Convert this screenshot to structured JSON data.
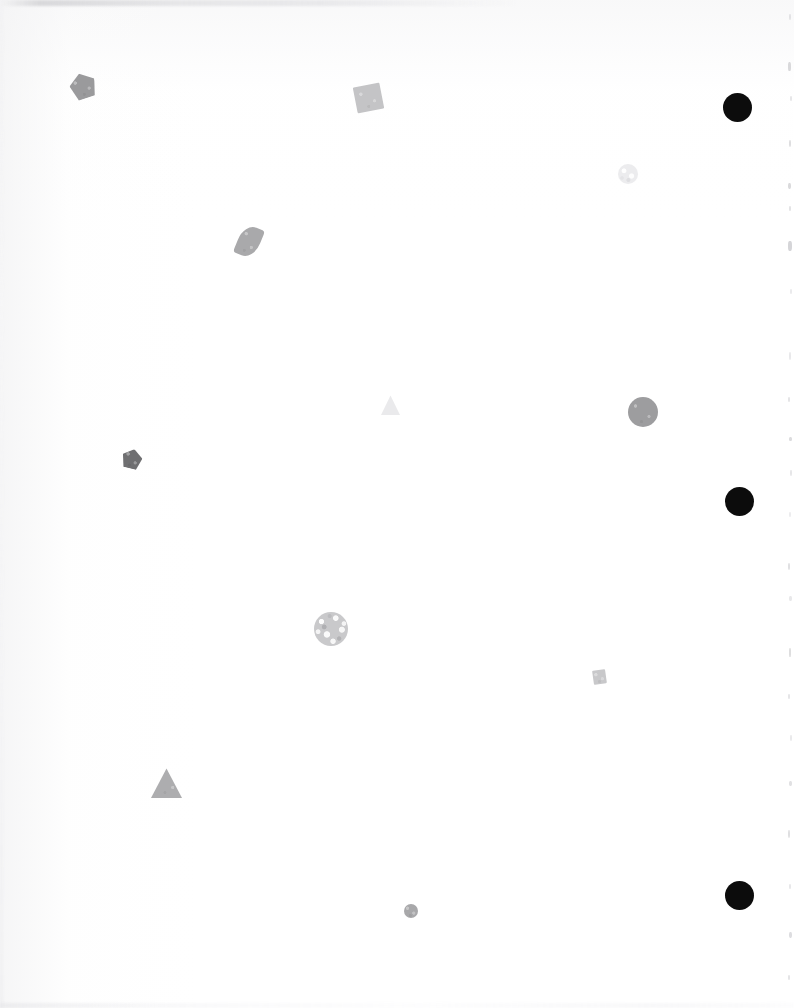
{
  "page": {
    "width": 794,
    "height": 1008,
    "background_color": "#ffffff",
    "shape_count": 13
  },
  "artifacts": {
    "top_smudge_label": "top-edge scan smudge",
    "bottom_smudge_label": "bottom-edge scan smudge",
    "left_edge_label": "left paper edge shading",
    "right_edge_label": "right margin specks",
    "right_edge_flecks": [
      {
        "x": 9,
        "y": 14,
        "w": 2,
        "h": 6,
        "color": "#e2e2e4"
      },
      {
        "x": 8,
        "y": 62,
        "w": 3,
        "h": 9,
        "color": "#d9d9db"
      },
      {
        "x": 10,
        "y": 96,
        "w": 2,
        "h": 5,
        "color": "#e6e6e8"
      },
      {
        "x": 9,
        "y": 140,
        "w": 2,
        "h": 7,
        "color": "#dedee0"
      },
      {
        "x": 8,
        "y": 183,
        "w": 3,
        "h": 6,
        "color": "#dadadc"
      },
      {
        "x": 9,
        "y": 206,
        "w": 2,
        "h": 5,
        "color": "#e3e3e5"
      },
      {
        "x": 8,
        "y": 241,
        "w": 4,
        "h": 10,
        "color": "#d5d5d8"
      },
      {
        "x": 10,
        "y": 289,
        "w": 2,
        "h": 5,
        "color": "#eaeaec"
      },
      {
        "x": 9,
        "y": 352,
        "w": 2,
        "h": 8,
        "color": "#e8e8ea"
      },
      {
        "x": 8,
        "y": 397,
        "w": 2,
        "h": 5,
        "color": "#e4e4e6"
      },
      {
        "x": 9,
        "y": 437,
        "w": 3,
        "h": 4,
        "color": "#dcdcde"
      },
      {
        "x": 10,
        "y": 470,
        "w": 2,
        "h": 6,
        "color": "#e6e6e8"
      },
      {
        "x": 9,
        "y": 512,
        "w": 2,
        "h": 5,
        "color": "#ececee"
      },
      {
        "x": 8,
        "y": 563,
        "w": 2,
        "h": 7,
        "color": "#e0e0e2"
      },
      {
        "x": 9,
        "y": 596,
        "w": 3,
        "h": 5,
        "color": "#e8e8ea"
      },
      {
        "x": 9,
        "y": 648,
        "w": 2,
        "h": 9,
        "color": "#dededf"
      },
      {
        "x": 8,
        "y": 694,
        "w": 2,
        "h": 5,
        "color": "#e5e5e7"
      },
      {
        "x": 10,
        "y": 735,
        "w": 2,
        "h": 6,
        "color": "#e9e9eb"
      },
      {
        "x": 9,
        "y": 781,
        "w": 3,
        "h": 5,
        "color": "#e1e1e3"
      },
      {
        "x": 8,
        "y": 830,
        "w": 2,
        "h": 8,
        "color": "#dfdfe1"
      },
      {
        "x": 9,
        "y": 884,
        "w": 2,
        "h": 5,
        "color": "#e7e7e9"
      },
      {
        "x": 9,
        "y": 932,
        "w": 3,
        "h": 6,
        "color": "#dddde0"
      },
      {
        "x": 8,
        "y": 975,
        "w": 2,
        "h": 5,
        "color": "#e4e4e6"
      }
    ]
  },
  "shapes": [
    {
      "id": "pentagon-top-left",
      "kind": "pentagon",
      "label": "gray pentagon",
      "x": 70,
      "y": 73,
      "w": 26,
      "h": 26,
      "rotation": -18,
      "color": "#9a9a9c",
      "texture": "grainy",
      "center_x": 83,
      "center_y": 86
    },
    {
      "id": "square-top-center",
      "kind": "square",
      "label": "light gray tilted square",
      "x": 355,
      "y": 85,
      "w": 27,
      "h": 26,
      "rotation": -11,
      "color": "#c4c4c6",
      "texture": "grainy",
      "center_x": 368,
      "center_y": 98
    },
    {
      "id": "circle-black-top-right",
      "kind": "circle",
      "label": "solid black circle",
      "x": 723,
      "y": 93,
      "w": 29,
      "h": 29,
      "rotation": 0,
      "color": "#0c0c0c",
      "texture": "solid",
      "center_x": 738,
      "center_y": 108
    },
    {
      "id": "circle-faint-upper-right",
      "kind": "circle",
      "label": "faint mottled circle",
      "x": 618,
      "y": 164,
      "w": 20,
      "h": 20,
      "rotation": 0,
      "color": "#e2e2e4",
      "texture": "faint-noise",
      "center_x": 628,
      "center_y": 174
    },
    {
      "id": "lens-upper-left",
      "kind": "lens",
      "label": "gray leaf-shaped blob",
      "x": 238,
      "y": 226,
      "w": 22,
      "h": 31,
      "rotation": 22,
      "color": "#a9a9ab",
      "texture": "grainy",
      "center_x": 249,
      "center_y": 241
    },
    {
      "id": "triangle-faint-center",
      "kind": "triangle",
      "label": "very faint light triangle",
      "x": 381,
      "y": 395,
      "w": 19,
      "h": 20,
      "rotation": 0,
      "color": "#eaeaec",
      "texture": "solid",
      "center_x": 390,
      "center_y": 405
    },
    {
      "id": "circle-gray-mid-right",
      "kind": "circle",
      "label": "medium gray circle",
      "x": 628,
      "y": 397,
      "w": 30,
      "h": 30,
      "rotation": 0,
      "color": "#9d9d9f",
      "texture": "grainy",
      "center_x": 643,
      "center_y": 412
    },
    {
      "id": "pentagon-mid-left",
      "kind": "pentagon",
      "label": "dark gray pentagon",
      "x": 122,
      "y": 449,
      "w": 20,
      "h": 20,
      "rotation": 14,
      "color": "#6f6f71",
      "texture": "grainy",
      "center_x": 132,
      "center_y": 459
    },
    {
      "id": "circle-black-mid-right",
      "kind": "circle",
      "label": "solid black circle",
      "x": 725,
      "y": 487,
      "w": 29,
      "h": 29,
      "rotation": 0,
      "color": "#0c0c0c",
      "texture": "solid",
      "center_x": 740,
      "center_y": 502
    },
    {
      "id": "circle-textured-center",
      "kind": "circle",
      "label": "mottled textured circle",
      "x": 314,
      "y": 612,
      "w": 34,
      "h": 34,
      "rotation": 0,
      "color": "#c9c9cb",
      "texture": "noise",
      "center_x": 331,
      "center_y": 629
    },
    {
      "id": "square-small-lower-right",
      "kind": "square",
      "label": "small light gray square",
      "x": 593,
      "y": 670,
      "w": 13,
      "h": 14,
      "rotation": -8,
      "color": "#c8c8ca",
      "texture": "grainy",
      "center_x": 599,
      "center_y": 677
    },
    {
      "id": "triangle-gray-lower-left",
      "kind": "triangle",
      "label": "gray triangle",
      "x": 151,
      "y": 768,
      "w": 31,
      "h": 30,
      "rotation": 0,
      "color": "#adadaf",
      "texture": "grainy",
      "center_x": 166,
      "center_y": 786
    },
    {
      "id": "circle-small-bottom-center",
      "kind": "circle",
      "label": "small gray circle",
      "x": 404,
      "y": 904,
      "w": 14,
      "h": 14,
      "rotation": 0,
      "color": "#a8a8aa",
      "texture": "grainy",
      "center_x": 411,
      "center_y": 911
    },
    {
      "id": "circle-black-bottom-right",
      "kind": "circle",
      "label": "solid black circle",
      "x": 725,
      "y": 881,
      "w": 29,
      "h": 29,
      "rotation": 0,
      "color": "#0c0c0c",
      "texture": "solid",
      "center_x": 740,
      "center_y": 895
    }
  ]
}
